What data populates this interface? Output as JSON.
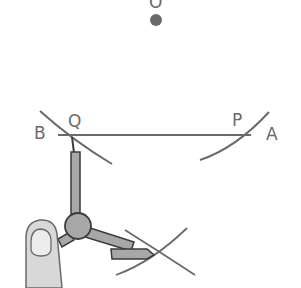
{
  "diagram": {
    "labels": {
      "O": "O",
      "B": "B",
      "Q": "Q",
      "P": "P",
      "A": "A"
    },
    "colors": {
      "line": "#6a6a6a",
      "point": "#6a6a6a",
      "compass_fill": "#a8a8a8",
      "compass_stroke": "#3a3a3a",
      "finger_fill": "#d8d8d8",
      "nail_fill": "#ececec"
    },
    "elements": [
      {
        "name": "point-O",
        "type": "point"
      },
      {
        "name": "line-AB",
        "type": "segment"
      },
      {
        "name": "arc-through-Q",
        "type": "arc"
      },
      {
        "name": "arc-through-P",
        "type": "arc"
      },
      {
        "name": "intersecting-arcs",
        "type": "arc-pair"
      },
      {
        "name": "compass",
        "type": "tool"
      },
      {
        "name": "finger",
        "type": "hand"
      }
    ]
  }
}
